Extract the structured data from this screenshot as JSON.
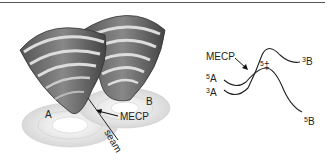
{
  "figure": {
    "left_panel": {
      "label_a": "A",
      "label_b": "B",
      "label_mecp": "MECP",
      "label_seam": "seam"
    },
    "right_panel": {
      "label_mecp": "MECP",
      "label_5a_sup": "5",
      "label_5a": "A",
      "label_3a_sup": "3",
      "label_3a": "A",
      "label_3b_sup": "3",
      "label_3b": "B",
      "label_5b_sup": "5",
      "label_5b": "B",
      "label_ts_sup": "5",
      "label_ts": "‡"
    }
  }
}
